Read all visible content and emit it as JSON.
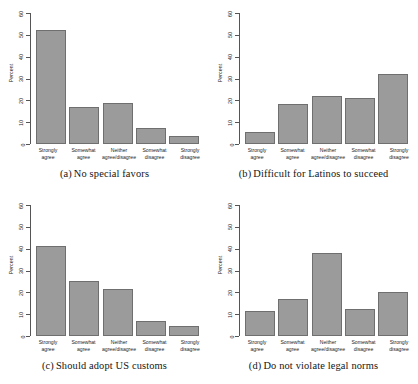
{
  "figure": {
    "background": "#ffffff",
    "bar_color": "#9b9b9b",
    "bar_border_color": "#6f6f6f",
    "axis_color": "#555555",
    "ylabel": "Percent",
    "categories": [
      {
        "line1": "Strongly",
        "line2": "agree"
      },
      {
        "line1": "Somewhat",
        "line2": "agree"
      },
      {
        "line1": "Neither",
        "line2": "agree/disagree"
      },
      {
        "line1": "Somewhat",
        "line2": "disagree"
      },
      {
        "line1": "Strongly",
        "line2": "disagree"
      }
    ],
    "yticks": [
      "0",
      "10",
      "20",
      "30",
      "40",
      "50",
      "60"
    ]
  },
  "chart_data": [
    {
      "type": "bar",
      "panel": "a",
      "caption_tag": "(a)",
      "caption_text": "No special favors",
      "title": "(a) No special favors",
      "categories": [
        "Strongly agree",
        "Somewhat agree",
        "Neither agree/disagree",
        "Somewhat disagree",
        "Strongly disagree"
      ],
      "values": [
        52,
        17,
        19,
        7.5,
        3.5
      ],
      "xlabel": "",
      "ylabel": "Percent",
      "ylim": [
        0,
        60
      ],
      "yticks": [
        0,
        10,
        20,
        30,
        40,
        50,
        60
      ],
      "grid": false,
      "legend": "none"
    },
    {
      "type": "bar",
      "panel": "b",
      "caption_tag": "(b)",
      "caption_text": "Difficult for Latinos to succeed",
      "title": "(b) Difficult for Latinos to succeed",
      "categories": [
        "Strongly agree",
        "Somewhat agree",
        "Neither agree/disagree",
        "Somewhat disagree",
        "Strongly disagree"
      ],
      "values": [
        5.5,
        18.5,
        22,
        21,
        32
      ],
      "xlabel": "",
      "ylabel": "Percent",
      "ylim": [
        0,
        60
      ],
      "yticks": [
        0,
        10,
        20,
        30,
        40,
        50,
        60
      ],
      "grid": false,
      "legend": "none"
    },
    {
      "type": "bar",
      "panel": "c",
      "caption_tag": "(c)",
      "caption_text": "Should adopt US customs",
      "title": "(c) Should adopt US customs",
      "categories": [
        "Strongly agree",
        "Somewhat agree",
        "Neither agree/disagree",
        "Somewhat disagree",
        "Strongly disagree"
      ],
      "values": [
        41,
        25,
        21.5,
        7,
        4.5
      ],
      "xlabel": "",
      "ylabel": "Percent",
      "ylim": [
        0,
        60
      ],
      "yticks": [
        0,
        10,
        20,
        30,
        40,
        50,
        60
      ],
      "grid": false,
      "legend": "none"
    },
    {
      "type": "bar",
      "panel": "d",
      "caption_tag": "(d)",
      "caption_text": "Do not violate legal norms",
      "title": "(d) Do not violate legal norms",
      "categories": [
        "Strongly agree",
        "Somewhat agree",
        "Neither agree/disagree",
        "Somewhat disagree",
        "Strongly disagree"
      ],
      "values": [
        11.5,
        17,
        38,
        12.5,
        20
      ],
      "xlabel": "",
      "ylabel": "Percent",
      "ylim": [
        0,
        60
      ],
      "yticks": [
        0,
        10,
        20,
        30,
        40,
        50,
        60
      ],
      "grid": false,
      "legend": "none"
    }
  ]
}
